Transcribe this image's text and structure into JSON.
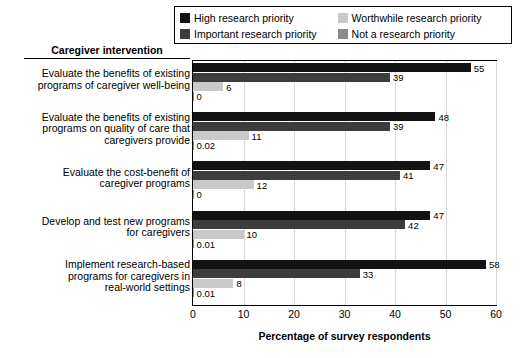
{
  "chart_data": {
    "type": "bar",
    "orientation": "horizontal",
    "grouped": true,
    "title": "",
    "xlabel": "Percentage of survey respondents",
    "ylabel": "Caregiver intervention",
    "xlim": [
      0,
      60
    ],
    "xticks": [
      0,
      10,
      20,
      30,
      40,
      50,
      60
    ],
    "grid": true,
    "legend_position": "top-right",
    "categories": [
      "Evaluate the benefits of existing programs of caregiver well-being",
      "Evaluate the benefits of existing programs on quality of care that caregivers provide",
      "Evaluate the cost-benefit of caregiver programs",
      "Develop and test new programs for caregivers",
      "Implement research-based programs for caregivers in real-world settings"
    ],
    "category_lines": [
      [
        "Evaluate the benefits of existing",
        "programs of caregiver well-being"
      ],
      [
        "Evaluate the benefits of existing",
        "programs on quality of care that",
        "caregivers provide"
      ],
      [
        "Evaluate the cost-benefit of",
        "caregiver programs"
      ],
      [
        "Develop and test new programs",
        "for caregivers"
      ],
      [
        "Implement research-based",
        "programs for caregivers in",
        "real-world settings"
      ]
    ],
    "series": [
      {
        "name": "High research priority",
        "color": "#121212",
        "values": [
          55,
          48,
          47,
          47,
          58
        ],
        "labels": [
          "55",
          "48",
          "47",
          "47",
          "58"
        ]
      },
      {
        "name": "Important research priority",
        "color": "#3d3d3d",
        "values": [
          39,
          39,
          41,
          42,
          33
        ],
        "labels": [
          "39",
          "39",
          "41",
          "42",
          "33"
        ]
      },
      {
        "name": "Worthwhile research priority",
        "color": "#c9c9c9",
        "values": [
          6,
          11,
          12,
          10,
          8
        ],
        "labels": [
          "6",
          "11",
          "12",
          "10",
          "8"
        ]
      },
      {
        "name": "Not a research priority",
        "color": "#8a8a8a",
        "values": [
          0,
          0.02,
          0,
          0.01,
          0.01
        ],
        "labels": [
          "0",
          "0.02",
          "0",
          "0.01",
          "0.01"
        ]
      }
    ]
  },
  "legend": {
    "entries": [
      {
        "label": "High research priority",
        "color": "#121212"
      },
      {
        "label": "Worthwhile research priority",
        "color": "#c9c9c9"
      },
      {
        "label": "Important research priority",
        "color": "#3d3d3d"
      },
      {
        "label": "Not a research priority",
        "color": "#8a8a8a"
      }
    ]
  },
  "axis": {
    "y_header": "Caregiver intervention",
    "x_label": "Percentage of survey respondents",
    "x_ticks": [
      "0",
      "10",
      "20",
      "30",
      "40",
      "50",
      "60"
    ]
  }
}
